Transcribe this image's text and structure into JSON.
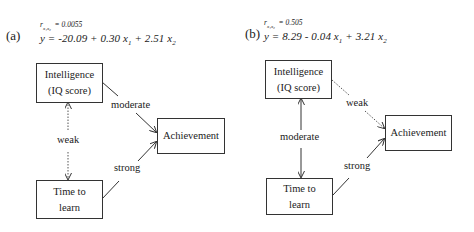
{
  "panels": [
    {
      "label": "(a)",
      "correlation": {
        "symbol": "r",
        "subscript": "x₁x₂",
        "value": "= 0.0055"
      },
      "equation": {
        "lhs": "y",
        "intercept": "= -20.09",
        "term1": "+ 0.30 x",
        "term1_sub": "1",
        "term2": "+  2.51 x",
        "term2_sub": "2"
      },
      "nodes": {
        "intelligence": {
          "line1": "Intelligence",
          "line2": "(IQ score)"
        },
        "achievement": {
          "line1": "Achievement"
        },
        "time": {
          "line1": "Time to",
          "line2": "learn"
        }
      },
      "edges": {
        "intelligence_achievement": {
          "label": "moderate",
          "style": "solid"
        },
        "intelligence_time": {
          "label": "weak",
          "style": "dotted"
        },
        "time_achievement": {
          "label": "strong",
          "style": "solid"
        }
      }
    },
    {
      "label": "(b)",
      "correlation": {
        "symbol": "r",
        "subscript": "x₁x₂",
        "value": "= 0.505"
      },
      "equation": {
        "lhs": "y",
        "intercept": "= 8.29",
        "term1": "- 0.04 x",
        "term1_sub": "1",
        "term2": "+ 3.21 x",
        "term2_sub": "2"
      },
      "nodes": {
        "intelligence": {
          "line1": "Intelligence",
          "line2": "(IQ score)"
        },
        "achievement": {
          "line1": "Achievement"
        },
        "time": {
          "line1": "Time to",
          "line2": "learn"
        }
      },
      "edges": {
        "intelligence_achievement": {
          "label": "weak",
          "style": "dotted"
        },
        "intelligence_time": {
          "label": "moderate",
          "style": "solid"
        },
        "time_achievement": {
          "label": "strong",
          "style": "solid"
        }
      }
    }
  ],
  "colors": {
    "line": "#333333",
    "text": "#222222",
    "background": "#ffffff"
  }
}
